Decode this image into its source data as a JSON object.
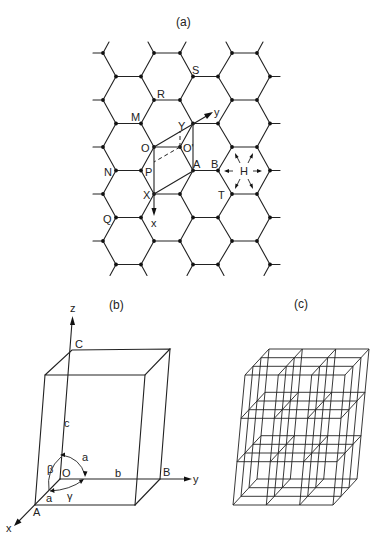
{
  "panels": {
    "a": {
      "label": "(a)",
      "title": "Hexagonal (honeycomb) net with lattice points and axes",
      "points": {
        "S": "S",
        "R": "R",
        "M": "M",
        "Y": "Y",
        "O": "O",
        "O_prime": "O'",
        "N": "N",
        "P": "P",
        "A": "A",
        "B": "B",
        "H": "H",
        "X": "X",
        "T": "T",
        "Q": "Q"
      },
      "axes": {
        "x": "x",
        "y": "y"
      }
    },
    "b": {
      "label": "(b)",
      "title": "Unit cell parallelepiped",
      "axes": {
        "x": "x",
        "y": "y",
        "z": "z"
      },
      "vertices": {
        "O": "O",
        "A": "A",
        "B": "B",
        "C": "C"
      },
      "edges": {
        "a": "a",
        "b": "b",
        "c": "c"
      },
      "angles": {
        "alpha": "a",
        "beta": "β",
        "gamma": "γ"
      }
    },
    "c": {
      "label": "(c)",
      "title": "3×3×3 stack of unit cells",
      "grid": {
        "nx": 3,
        "ny": 3,
        "nz": 3
      }
    }
  },
  "colors": {
    "ink": "#222222",
    "background": "#ffffff"
  }
}
